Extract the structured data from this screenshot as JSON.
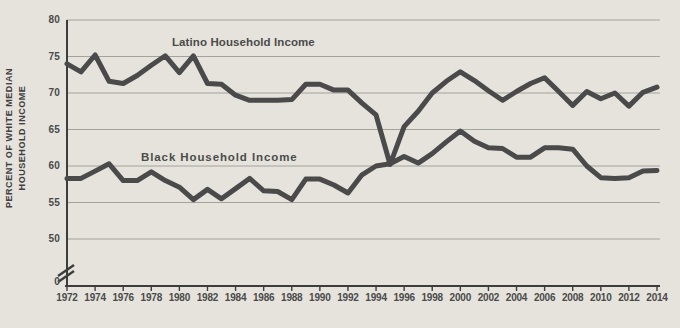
{
  "chart": {
    "y_axis_title_line1": "PERCENT OF WHITE MEDIAN",
    "y_axis_title_line2": "HOUSEHOLD INCOME",
    "zero_label": "0",
    "colors": {
      "background": "#e5e3dc",
      "line": "#4a4a4a",
      "gridline": "#a3a29c",
      "axis": "#3d3d3d",
      "text": "#454545"
    }
  },
  "chart_data": {
    "type": "line",
    "title": "",
    "xlabel": "",
    "ylabel": "PERCENT OF WHITE MEDIAN HOUSEHOLD INCOME",
    "x": [
      1972,
      1973,
      1974,
      1975,
      1976,
      1977,
      1978,
      1979,
      1980,
      1981,
      1982,
      1983,
      1984,
      1985,
      1986,
      1987,
      1988,
      1989,
      1990,
      1991,
      1992,
      1993,
      1994,
      1995,
      1996,
      1997,
      1998,
      1999,
      2000,
      2001,
      2002,
      2003,
      2004,
      2005,
      2006,
      2007,
      2008,
      2009,
      2010,
      2011,
      2012,
      2013,
      2014
    ],
    "series": [
      {
        "name": "Latino Household Income",
        "values": [
          74,
          72.9,
          75.2,
          71.6,
          71.3,
          72.4,
          73.8,
          75.1,
          72.8,
          75.1,
          71.3,
          71.2,
          69.7,
          69,
          69,
          69,
          69.1,
          71.2,
          71.2,
          70.4,
          70.4,
          68.6,
          67,
          60.2,
          65.4,
          67.5,
          70,
          71.6,
          72.9,
          71.7,
          70.3,
          69,
          70.2,
          71.3,
          72.1,
          70.2,
          68.3,
          70.2,
          69.2,
          70,
          68.2,
          70.1,
          70.8
        ]
      },
      {
        "name": "Black Household Income",
        "values": [
          58.3,
          58.3,
          59.3,
          60.3,
          58,
          58,
          59.2,
          58,
          57.1,
          55.4,
          56.8,
          55.5,
          56.9,
          58.3,
          56.6,
          56.5,
          55.4,
          58.2,
          58.2,
          57.4,
          56.3,
          58.8,
          60,
          60.3,
          61.3,
          60.4,
          61.7,
          63.3,
          64.8,
          63.4,
          62.5,
          62.4,
          61.2,
          61.2,
          62.5,
          62.5,
          62.3,
          60,
          58.4,
          58.3,
          58.4,
          59.3,
          59.4
        ],
        "label_letter_spacing_note": ""
      }
    ],
    "yticks": [
      80,
      75,
      70,
      65,
      60,
      55,
      50
    ],
    "xticks": [
      1972,
      1974,
      1976,
      1978,
      1980,
      1982,
      1984,
      1986,
      1988,
      1990,
      1992,
      1994,
      1996,
      1998,
      2000,
      2002,
      2004,
      2006,
      2008,
      2010,
      2012,
      2014
    ],
    "axis_break": true,
    "ylim": [
      50,
      80
    ],
    "grid": true,
    "legend_position": "inline-labels"
  }
}
